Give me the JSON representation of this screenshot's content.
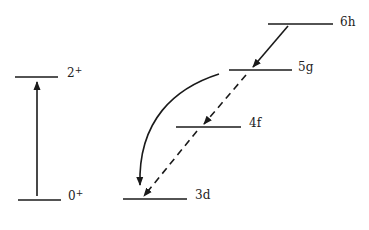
{
  "diagram": {
    "type": "energy-level-diagram",
    "colors": {
      "line": "#1a1a1a",
      "text": "#222222",
      "background": "#ffffff"
    },
    "left_scheme": {
      "levels": [
        {
          "id": "2plus",
          "label_base": "2",
          "label_sup": "+"
        },
        {
          "id": "0plus",
          "label_base": "0",
          "label_sup": "+"
        }
      ],
      "transitions": [
        {
          "from": "0+",
          "to": "2+",
          "style": "solid",
          "direction": "up"
        }
      ]
    },
    "right_scheme": {
      "levels": [
        {
          "id": "6h",
          "label": "6h"
        },
        {
          "id": "5g",
          "label": "5g"
        },
        {
          "id": "4f",
          "label": "4f"
        },
        {
          "id": "3d",
          "label": "3d"
        }
      ],
      "transitions": [
        {
          "from": "6h",
          "to": "5g",
          "style": "solid"
        },
        {
          "from": "5g",
          "to": "4f",
          "style": "dashed"
        },
        {
          "from": "4f",
          "to": "3d",
          "style": "dashed"
        },
        {
          "from": "5g",
          "to": "3d",
          "style": "solid-curved"
        }
      ]
    }
  }
}
